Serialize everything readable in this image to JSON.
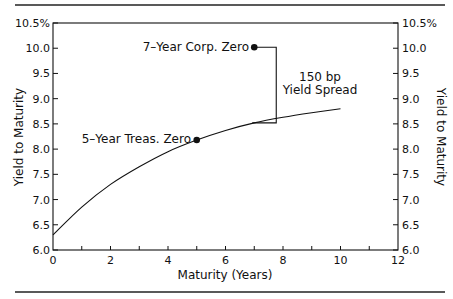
{
  "chart_data": {
    "type": "line",
    "title": "",
    "xlabel": "Maturity (Years)",
    "ylabel_left": "Yield to Maturity",
    "ylabel_right": "Yield to Maturity",
    "xlim": [
      0,
      12
    ],
    "ylim": [
      6.0,
      10.5
    ],
    "x_ticks": [
      0,
      2,
      4,
      6,
      8,
      10,
      12
    ],
    "x_minor_ticks": [
      1,
      3,
      5,
      7,
      9,
      11
    ],
    "y_ticks": [
      "6.0",
      "6.5",
      "7.0",
      "7.5",
      "8.0",
      "8.5",
      "9.0",
      "9.5",
      "10.0",
      "10.5%"
    ],
    "grid": false,
    "series": [
      {
        "name": "Treasury zero yield curve",
        "x": [
          0,
          1,
          2,
          3,
          4,
          5,
          6,
          7,
          8,
          9,
          10
        ],
        "values": [
          6.3,
          6.85,
          7.3,
          7.65,
          7.95,
          8.18,
          8.37,
          8.52,
          8.63,
          8.72,
          8.8
        ]
      }
    ],
    "points": [
      {
        "label": "5-Year Treas. Zero",
        "x": 5,
        "y": 8.18
      },
      {
        "label": "7-Year Corp. Zero",
        "x": 7,
        "y": 10.02
      }
    ],
    "annotations": [
      {
        "text_line1": "150 bp",
        "text_line2": "Yield Spread",
        "from_y": 10.02,
        "to_y": 8.52,
        "at_x": 7
      }
    ],
    "legend": "none"
  },
  "labels": {
    "xlabel": "Maturity (Years)",
    "ylabel_left": "Yield to Maturity",
    "ylabel_right": "Yield to Maturity",
    "corp_point": "7–Year Corp. Zero",
    "treas_point": "5–Year Treas. Zero",
    "spread_line1": "150 bp",
    "spread_line2": "Yield Spread"
  }
}
